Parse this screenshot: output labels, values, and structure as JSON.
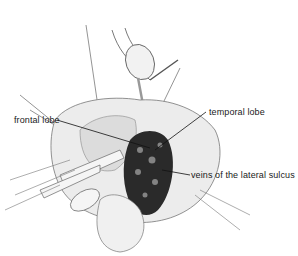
{
  "figure": {
    "type": "surgical-illustration",
    "labels": [
      {
        "id": "frontal",
        "text": "frontal lobe"
      },
      {
        "id": "temporal",
        "text": "temporal lobe"
      },
      {
        "id": "veins",
        "text": "veins of the lateral sulcus"
      }
    ],
    "colors": {
      "background": "#ffffff",
      "ink": "#1a1a1a",
      "shadow": "#2a2a2a",
      "tissue_light": "#ececec",
      "tissue_mid": "#bdbdbd"
    }
  }
}
